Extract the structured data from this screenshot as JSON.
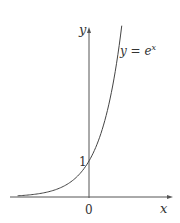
{
  "chart_data": {
    "type": "line",
    "title": "",
    "xlabel": "x",
    "ylabel": "y",
    "series": [
      {
        "name": "y = e^x",
        "label_main": "y = e",
        "label_sup": "x",
        "function": "exp",
        "x": [
          -3.4,
          -3,
          -2.5,
          -2,
          -1.5,
          -1,
          -0.5,
          0,
          0.5,
          1,
          1.25,
          1.56
        ],
        "values": [
          0.033,
          0.05,
          0.082,
          0.135,
          0.223,
          0.368,
          0.607,
          1,
          1.649,
          2.718,
          3.49,
          4.76
        ]
      }
    ],
    "annotations": {
      "origin_label": "0",
      "y_intercept_label": "1",
      "x_axis_label": "x",
      "y_axis_label": "y"
    },
    "xlim": [
      -3.7,
      3.8
    ],
    "ylim": [
      0,
      4.7
    ],
    "grid": false,
    "legend": "none",
    "colors": {
      "axis": "#555555",
      "curve": "#444444",
      "text": "#333333"
    }
  }
}
